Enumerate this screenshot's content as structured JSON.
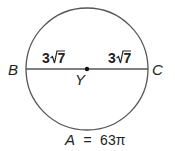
{
  "diagram": {
    "type": "circle-geometry",
    "stroke_color": "#555555",
    "text_color": "#222222",
    "circle": {
      "cx": 87,
      "cy": 69,
      "r": 61
    },
    "diameter": {
      "from_point": "B",
      "to_point": "C",
      "through_center": "Y"
    },
    "points": {
      "left": "B",
      "right": "C",
      "center": "Y"
    },
    "segments": {
      "BY_length": "3√7",
      "YC_length": "3√7",
      "left_coefficient": "3",
      "left_radicand": "7",
      "right_coefficient": "3",
      "right_radicand": "7"
    },
    "area": {
      "variable": "A",
      "equals": "=",
      "value": "63π",
      "full_text": "A = 63π"
    }
  }
}
